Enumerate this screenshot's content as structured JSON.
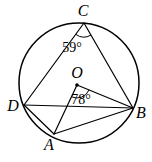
{
  "diagram": {
    "background_color": "#ffffff",
    "stroke_color": "#000000",
    "circle": {
      "cx": 79,
      "cy": 83,
      "r": 60
    },
    "center_dot": {
      "x": 77,
      "y": 85,
      "r": 1.8
    },
    "points": {
      "C": {
        "x": 84,
        "y": 23
      },
      "D": {
        "x": 24,
        "y": 105
      },
      "B": {
        "x": 133,
        "y": 108
      },
      "A": {
        "x": 54,
        "y": 134
      },
      "O": {
        "x": 77,
        "y": 85
      }
    },
    "labels": {
      "C": {
        "text": "C",
        "x": 83,
        "y": 16
      },
      "O": {
        "text": "O",
        "x": 77,
        "y": 78
      },
      "D": {
        "text": "D",
        "x": 13,
        "y": 111
      },
      "B": {
        "text": "B",
        "x": 141,
        "y": 118
      },
      "A": {
        "text": "A",
        "x": 49,
        "y": 150
      }
    },
    "angle_annotations": [
      {
        "vertex": "C",
        "between": [
          "D",
          "B"
        ],
        "text": "59°",
        "label_x": 72,
        "label_y": 52,
        "arc_d": "M 75.7 34.3 A 14 14 0 0 0 91 35.1"
      },
      {
        "vertex": "O",
        "between": [
          "A",
          "B"
        ],
        "text": "78°",
        "label_x": 81,
        "label_y": 104,
        "arc_d": "M 71.5 96.8 A 13 13 0 0 0 89 89.9"
      }
    ],
    "segments": [
      {
        "name": "CD",
        "from": "C",
        "to": "D"
      },
      {
        "name": "CB",
        "from": "C",
        "to": "B"
      },
      {
        "name": "DB",
        "from": "D",
        "to": "B"
      },
      {
        "name": "DA",
        "from": "D",
        "to": "A"
      },
      {
        "name": "AB",
        "from": "A",
        "to": "B"
      },
      {
        "name": "OA",
        "from": "O",
        "to": "A"
      },
      {
        "name": "OB",
        "from": "O",
        "to": "B"
      }
    ]
  }
}
